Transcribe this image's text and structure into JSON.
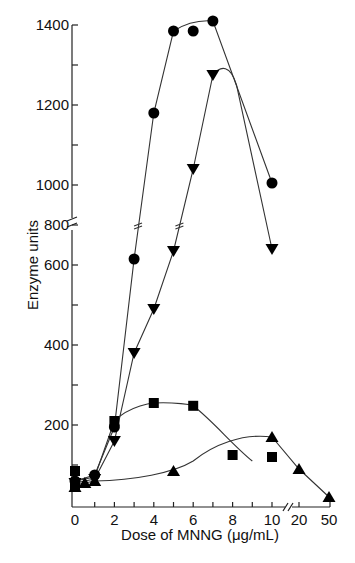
{
  "chart_data": {
    "type": "line",
    "title": "",
    "xlabel": "Dose of MNNG (μg/mL)",
    "ylabel": "Enzyme units",
    "x_ticks": [
      "0",
      "2",
      "4",
      "6",
      "8",
      "10",
      "20",
      "50"
    ],
    "y_ticks": [
      "200",
      "400",
      "600",
      "800",
      "1000",
      "1200",
      "1400"
    ],
    "x_axis_break": "between 10 and 20",
    "y_axis_break": "between 800 and 1000",
    "ylim": [
      0,
      1400
    ],
    "grid": false,
    "legend": null,
    "series": [
      {
        "name": "circles",
        "marker": "circle",
        "points": [
          [
            0,
            60
          ],
          [
            1,
            75
          ],
          [
            2,
            195
          ],
          [
            3,
            630
          ],
          [
            4,
            1180
          ],
          [
            5,
            1385
          ],
          [
            6,
            1385
          ],
          [
            7,
            1410
          ],
          [
            10,
            1005
          ]
        ]
      },
      {
        "name": "down-triangles",
        "marker": "triangle-down",
        "points": [
          [
            0,
            55
          ],
          [
            1,
            65
          ],
          [
            2,
            160
          ],
          [
            3,
            380
          ],
          [
            4,
            490
          ],
          [
            5,
            670
          ],
          [
            6,
            1040
          ],
          [
            7,
            1275
          ],
          [
            10,
            840
          ]
        ]
      },
      {
        "name": "squares",
        "marker": "square",
        "points": [
          [
            0,
            85
          ],
          [
            0,
            50
          ],
          [
            2,
            210
          ],
          [
            4,
            255
          ],
          [
            6,
            248
          ],
          [
            8,
            125
          ],
          [
            10,
            120
          ]
        ]
      },
      {
        "name": "up-triangles",
        "marker": "triangle-up",
        "points": [
          [
            0,
            45
          ],
          [
            0.5,
            55
          ],
          [
            1,
            60
          ],
          [
            5,
            85
          ],
          [
            10,
            170
          ],
          [
            20,
            90
          ],
          [
            50,
            20
          ]
        ]
      }
    ]
  },
  "labels": {
    "xlabel": "Dose of MNNG (μg/mL)",
    "ylabel": "Enzyme units"
  }
}
